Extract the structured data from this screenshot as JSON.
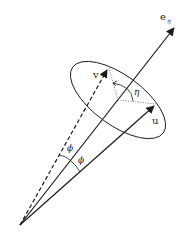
{
  "diagram": {
    "labels": {
      "axis": "e",
      "axis_sub": "η",
      "v": "v",
      "u": "u",
      "eta": "η",
      "phi_upper": "ϕ",
      "phi_lower": "ϕ"
    },
    "colors": {
      "stroke": "#1a1a1a",
      "dotted": "#555555"
    }
  }
}
